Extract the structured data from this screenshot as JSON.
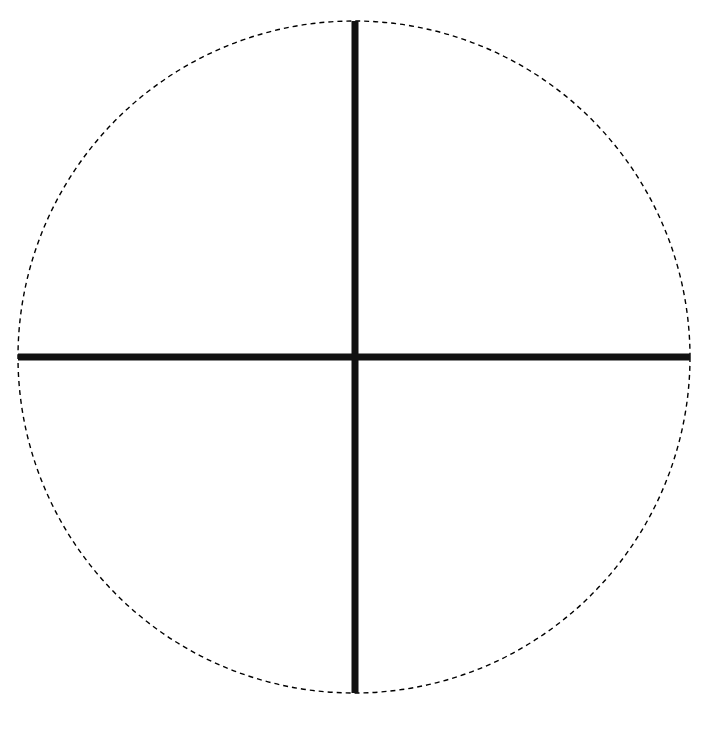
{
  "diagram": {
    "type": "circle-with-crosshair",
    "background": "#ffffff",
    "circle": {
      "cx": 354,
      "cy": 357,
      "r": 336,
      "stroke": "#000000",
      "stroke_width": 1.4,
      "dash": "5 4",
      "style": "dashed"
    },
    "vertical_axis": {
      "x": 355,
      "y1": 21,
      "y2": 693,
      "stroke": "#111111",
      "stroke_width": 7
    },
    "horizontal_axis": {
      "y": 357,
      "x1": 18,
      "x2": 690,
      "stroke": "#111111",
      "stroke_width": 7
    }
  }
}
